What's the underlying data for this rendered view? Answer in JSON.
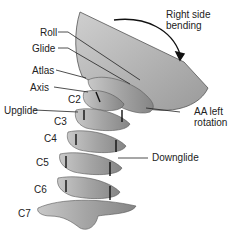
{
  "figure": {
    "type": "anatomical-illustration",
    "colors": {
      "bone": "#a9a9a9",
      "bone_shadow": "#7d7d7d",
      "bone_highlight": "#dcdcdc",
      "skull": "#b9b9b9",
      "ink": "#222222"
    }
  },
  "labels": {
    "right_side_bending": "Right side",
    "right_side_bending_2": "bending",
    "roll": "Roll",
    "glide": "Glide",
    "atlas": "Atlas",
    "axis": "Axis",
    "c2": "C2",
    "upglide": "Upglide",
    "c3": "C3",
    "c4": "C4",
    "c5": "C5",
    "c6": "C6",
    "c7": "C7",
    "aa_left_rotation": "AA left",
    "aa_left_rotation_2": "rotation",
    "downglide": "Downglide"
  }
}
